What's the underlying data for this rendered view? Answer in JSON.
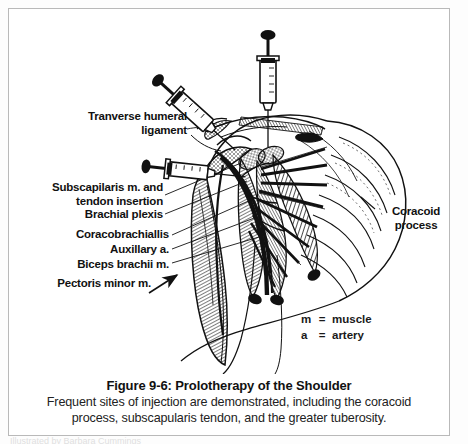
{
  "figure": {
    "title": "Figure 9-6: Prolotherapy of the Shoulder",
    "caption_line_1": "Frequent sites of injection are demonstrated, including the coracoid",
    "caption_line_2": "process, subscapularis tendon, and the greater tuberosity.",
    "bleed_text": "Illustrated by Barbara Cummings"
  },
  "labels": {
    "transverse_humeral_ligament": "Tranverse humeral\nligament",
    "transverse_humeral_ligament_l1": "Tranverse humeral",
    "transverse_humeral_ligament_l2": "ligament",
    "subscapularis_l1": "Subscapilaris m. and",
    "subscapularis_l2": "tendon insertion",
    "brachial_plexus": "Brachial plexis",
    "coracobrachialis": "Coracobrachiallis",
    "axillary_artery": "Auxillary a.",
    "biceps_brachii": "Biceps brachii m.",
    "pectoralis_minor": "Pectoris minor m.",
    "coracoid_l1": "Coracoid",
    "coracoid_l2": "process"
  },
  "legend": {
    "rows": [
      {
        "symbol": "m",
        "equals": "=",
        "meaning": "muscle"
      },
      {
        "symbol": "a",
        "equals": "=",
        "meaning": "artery"
      }
    ]
  },
  "illustration": {
    "description": "Line-art anatomical drawing of the shoulder region with three syringes injecting at the transverse humeral ligament, coracoid process and subscapularis tendon",
    "syringe_count": 3,
    "syringes": [
      {
        "name": "syringe-upper-left",
        "angle_deg": 42
      },
      {
        "name": "syringe-top-center",
        "angle_deg": 0
      },
      {
        "name": "syringe-mid-left",
        "angle_deg": 90
      }
    ],
    "ink_color": "#101010",
    "paper_color": "#ffffff"
  },
  "colors": {
    "border": "#b9b9b9",
    "ink": "#101010",
    "text": "#111111"
  }
}
